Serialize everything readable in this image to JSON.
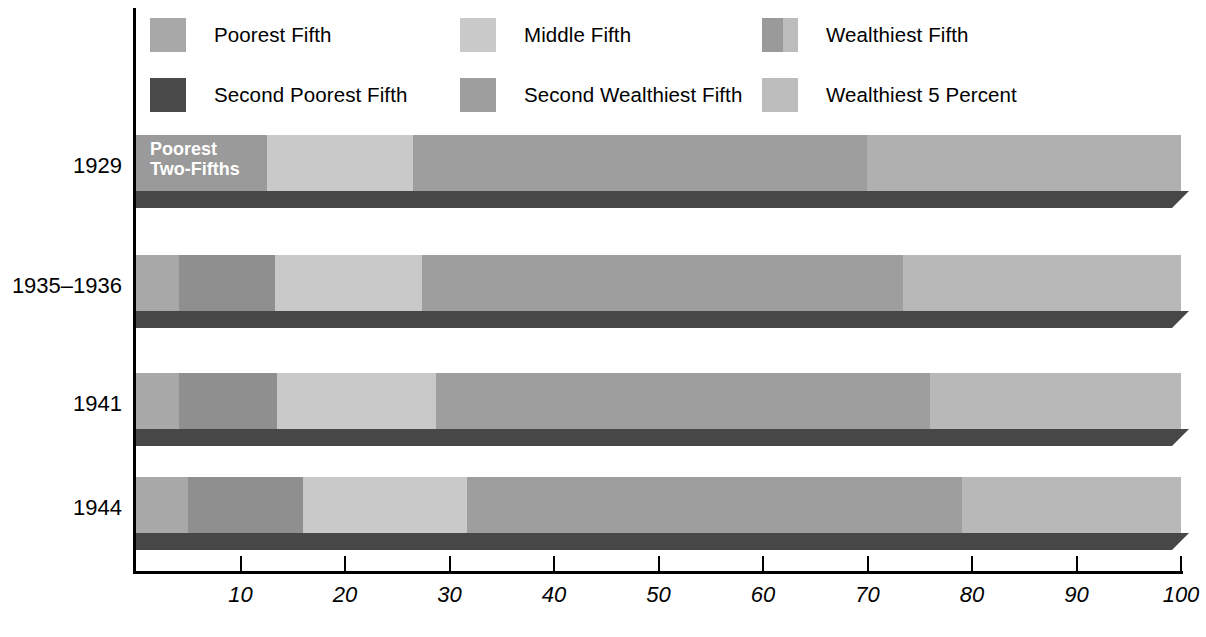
{
  "chart_data": {
    "type": "bar",
    "orientation": "horizontal",
    "stacked": true,
    "title": "",
    "subtitle": "",
    "xlabel": "",
    "ylabel": "",
    "xlim": [
      0,
      100
    ],
    "xticks": [
      10,
      20,
      30,
      40,
      50,
      60,
      70,
      80,
      90,
      100
    ],
    "xticklabels": [
      "10",
      "20",
      "30",
      "40",
      "50",
      "60",
      "70",
      "80",
      "90",
      "100"
    ],
    "grid": false,
    "legend_position": "top",
    "categories": [
      "1929",
      "1935–1936",
      "1941",
      "1944"
    ],
    "series": [
      {
        "name": "Poorest Fifth",
        "key": "poorest",
        "color": "#a8a8a8",
        "values": [
          null,
          4.1,
          4.1,
          5.0
        ]
      },
      {
        "name": "Second Poorest Fifth",
        "key": "second_poorest",
        "color": "#4a4a4a",
        "values": [
          null,
          9.2,
          9.5,
          11.0
        ]
      },
      {
        "name": "Poorest Two-Fifths",
        "key": "poorest_two_fifths",
        "color": "#9a9a9a",
        "values": [
          12.5,
          null,
          null,
          null
        ]
      },
      {
        "name": "Middle Fifth",
        "key": "middle",
        "color": "#c9c9c9",
        "values": [
          14.0,
          14.1,
          15.3,
          15.8
        ]
      },
      {
        "name": "Second Wealthiest Fifth",
        "key": "second_wealthiest",
        "color": "#9e9e9e",
        "values": [
          43.5,
          46.0,
          47.2,
          47.2
        ]
      },
      {
        "name": "Wealthiest Fifth",
        "key": "wealthiest",
        "color": "#8e8e8e",
        "values": [
          30.0,
          26.5,
          24.0,
          21.0
        ]
      },
      {
        "name": "Wealthiest 5 Percent",
        "key": "wealthiest_5pct",
        "color": "#bcbcbc",
        "values": [
          null,
          null,
          null,
          null
        ]
      }
    ],
    "annotations": [
      {
        "text": "Poorest\nTwo-Fifths",
        "category": "1929",
        "series": "Poorest Two-Fifths",
        "color": "#ffffff"
      }
    ]
  },
  "legend": {
    "items": [
      {
        "label": "Poorest Fifth",
        "swatch": "legend-swatch-poorest-fifth",
        "color": "#a8a8a8",
        "color2": null,
        "split": false
      },
      {
        "label": "Middle Fifth",
        "swatch": "legend-swatch-middle-fifth",
        "color": "#c9c9c9",
        "color2": null,
        "split": false
      },
      {
        "label": "Wealthiest Fifth",
        "swatch": "legend-swatch-wealthiest-fifth",
        "color": "#9a9a9a",
        "color2": "#bcbcbc",
        "split": true
      },
      {
        "label": "Second Poorest Fifth",
        "swatch": "legend-swatch-second-poorest-fifth",
        "color": "#4a4a4a",
        "color2": null,
        "split": false
      },
      {
        "label": "Second Wealthiest Fifth",
        "swatch": "legend-swatch-second-wealthiest-fifth",
        "color": "#9e9e9e",
        "color2": null,
        "split": false
      },
      {
        "label": "Wealthiest 5 Percent",
        "swatch": "legend-swatch-wealthiest-5-percent",
        "color": "#bcbcbc",
        "color2": null,
        "split": false
      }
    ]
  },
  "axis": {
    "base_color": "#000000",
    "bar_shadow_color": "#474747"
  },
  "rows": [
    {
      "label": "1929",
      "top": 135,
      "segments": [
        {
          "name": "Poorest Two-Fifths",
          "value": 12.5,
          "color": "#9a9a9a",
          "text": "Poorest\nTwo-Fifths"
        },
        {
          "name": "Middle Fifth",
          "value": 14.0,
          "color": "#c9c9c9",
          "text": ""
        },
        {
          "name": "Second Wealthiest Fifth",
          "value": 43.5,
          "color": "#9e9e9e",
          "text": ""
        },
        {
          "name": "Wealthiest Fifth",
          "value": 30.0,
          "color": "#b0b0b0",
          "text": ""
        }
      ]
    },
    {
      "label": "1935–1936",
      "top": 255,
      "segments": [
        {
          "name": "Poorest Fifth",
          "value": 4.1,
          "color": "#a8a8a8",
          "text": ""
        },
        {
          "name": "Second Poorest Fifth",
          "value": 9.2,
          "color": "#8f8f8f",
          "text": ""
        },
        {
          "name": "Middle Fifth",
          "value": 14.1,
          "color": "#c9c9c9",
          "text": ""
        },
        {
          "name": "Second Wealthiest Fifth",
          "value": 46.0,
          "color": "#9e9e9e",
          "text": ""
        },
        {
          "name": "Wealthiest Fifth",
          "value": 26.6,
          "color": "#b8b8b8",
          "text": ""
        }
      ]
    },
    {
      "label": "1941",
      "top": 373,
      "segments": [
        {
          "name": "Poorest Fifth",
          "value": 4.1,
          "color": "#a8a8a8",
          "text": ""
        },
        {
          "name": "Second Poorest Fifth",
          "value": 9.4,
          "color": "#8f8f8f",
          "text": ""
        },
        {
          "name": "Middle Fifth",
          "value": 15.2,
          "color": "#c9c9c9",
          "text": ""
        },
        {
          "name": "Second Wealthiest Fifth",
          "value": 47.3,
          "color": "#9e9e9e",
          "text": ""
        },
        {
          "name": "Wealthiest Fifth",
          "value": 24.0,
          "color": "#b8b8b8",
          "text": ""
        }
      ]
    },
    {
      "label": "1944",
      "top": 477,
      "segments": [
        {
          "name": "Poorest Fifth",
          "value": 5.0,
          "color": "#a8a8a8",
          "text": ""
        },
        {
          "name": "Second Poorest Fifth",
          "value": 11.0,
          "color": "#8f8f8f",
          "text": ""
        },
        {
          "name": "Middle Fifth",
          "value": 15.7,
          "color": "#c9c9c9",
          "text": ""
        },
        {
          "name": "Second Wealthiest Fifth",
          "value": 47.3,
          "color": "#9e9e9e",
          "text": ""
        },
        {
          "name": "Wealthiest Fifth",
          "value": 21.0,
          "color": "#b8b8b8",
          "text": ""
        }
      ]
    }
  ]
}
